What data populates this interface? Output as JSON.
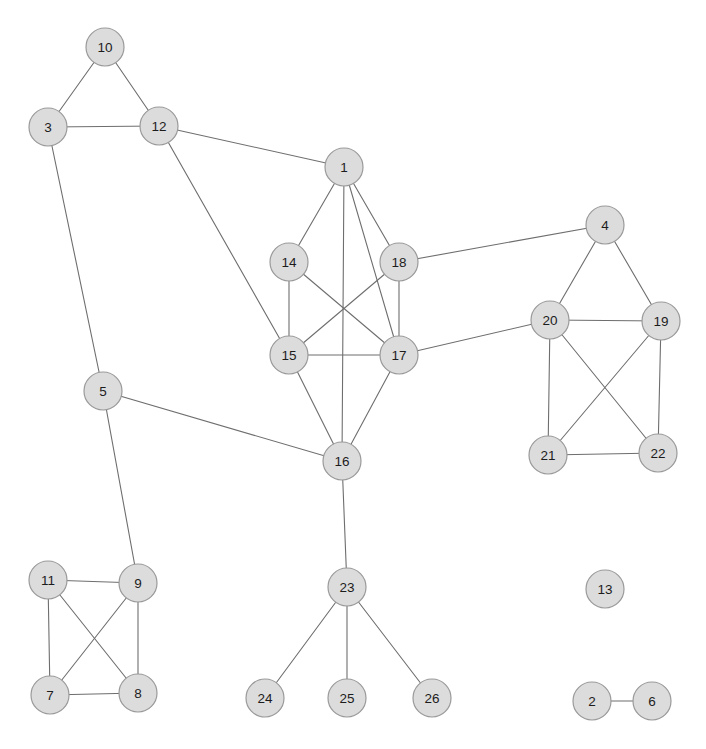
{
  "figure": {
    "type": "network-graph",
    "width": 706,
    "height": 749,
    "background_color": "#ffffff"
  },
  "style": {
    "node_fill": "#dcdcdc",
    "node_stroke": "#9a9a9a",
    "node_radius": 19,
    "node_label_color": "#1c1c1c",
    "edge_color": "#6e6e6e",
    "edge_width": 1.1
  },
  "chart_data": {
    "type": "graph",
    "title": "",
    "node_count": 26,
    "edge_count": 42,
    "directed": false,
    "nodes": [
      {
        "id": 1,
        "label": "1",
        "x": 344,
        "y": 167
      },
      {
        "id": 2,
        "label": "2",
        "x": 592,
        "y": 701
      },
      {
        "id": 3,
        "label": "3",
        "x": 48,
        "y": 127
      },
      {
        "id": 4,
        "label": "4",
        "x": 605,
        "y": 225
      },
      {
        "id": 5,
        "label": "5",
        "x": 103,
        "y": 391
      },
      {
        "id": 6,
        "label": "6",
        "x": 652,
        "y": 701
      },
      {
        "id": 7,
        "label": "7",
        "x": 50,
        "y": 695
      },
      {
        "id": 8,
        "label": "8",
        "x": 138,
        "y": 693
      },
      {
        "id": 9,
        "label": "9",
        "x": 138,
        "y": 583
      },
      {
        "id": 10,
        "label": "10",
        "x": 105,
        "y": 47
      },
      {
        "id": 11,
        "label": "11",
        "x": 48,
        "y": 580
      },
      {
        "id": 12,
        "label": "12",
        "x": 159,
        "y": 126
      },
      {
        "id": 13,
        "label": "13",
        "x": 605,
        "y": 589
      },
      {
        "id": 14,
        "label": "14",
        "x": 289,
        "y": 262
      },
      {
        "id": 15,
        "label": "15",
        "x": 289,
        "y": 355
      },
      {
        "id": 16,
        "label": "16",
        "x": 342,
        "y": 461
      },
      {
        "id": 17,
        "label": "17",
        "x": 399,
        "y": 355
      },
      {
        "id": 18,
        "label": "18",
        "x": 399,
        "y": 262
      },
      {
        "id": 19,
        "label": "19",
        "x": 661,
        "y": 321
      },
      {
        "id": 20,
        "label": "20",
        "x": 550,
        "y": 320
      },
      {
        "id": 21,
        "label": "21",
        "x": 548,
        "y": 455
      },
      {
        "id": 22,
        "label": "22",
        "x": 658,
        "y": 453
      },
      {
        "id": 23,
        "label": "23",
        "x": 347,
        "y": 587
      },
      {
        "id": 24,
        "label": "24",
        "x": 265,
        "y": 698
      },
      {
        "id": 25,
        "label": "25",
        "x": 347,
        "y": 698
      },
      {
        "id": 26,
        "label": "26",
        "x": 432,
        "y": 698
      }
    ],
    "edges": [
      {
        "source": 10,
        "target": 3
      },
      {
        "source": 10,
        "target": 12
      },
      {
        "source": 3,
        "target": 12
      },
      {
        "source": 3,
        "target": 5
      },
      {
        "source": 12,
        "target": 1
      },
      {
        "source": 12,
        "target": 15
      },
      {
        "source": 5,
        "target": 9
      },
      {
        "source": 5,
        "target": 16
      },
      {
        "source": 1,
        "target": 14
      },
      {
        "source": 1,
        "target": 18
      },
      {
        "source": 1,
        "target": 17
      },
      {
        "source": 1,
        "target": 16
      },
      {
        "source": 14,
        "target": 15
      },
      {
        "source": 14,
        "target": 17
      },
      {
        "source": 15,
        "target": 17
      },
      {
        "source": 15,
        "target": 18
      },
      {
        "source": 15,
        "target": 16
      },
      {
        "source": 18,
        "target": 17
      },
      {
        "source": 18,
        "target": 4
      },
      {
        "source": 17,
        "target": 16
      },
      {
        "source": 17,
        "target": 20
      },
      {
        "source": 16,
        "target": 23
      },
      {
        "source": 4,
        "target": 20
      },
      {
        "source": 4,
        "target": 19
      },
      {
        "source": 20,
        "target": 19
      },
      {
        "source": 20,
        "target": 21
      },
      {
        "source": 20,
        "target": 22
      },
      {
        "source": 19,
        "target": 21
      },
      {
        "source": 19,
        "target": 22
      },
      {
        "source": 21,
        "target": 22
      },
      {
        "source": 11,
        "target": 9
      },
      {
        "source": 11,
        "target": 7
      },
      {
        "source": 11,
        "target": 8
      },
      {
        "source": 9,
        "target": 7
      },
      {
        "source": 9,
        "target": 8
      },
      {
        "source": 7,
        "target": 8
      },
      {
        "source": 23,
        "target": 24
      },
      {
        "source": 23,
        "target": 25
      },
      {
        "source": 23,
        "target": 26
      },
      {
        "source": 2,
        "target": 6
      }
    ],
    "isolated_nodes": [
      13
    ],
    "components": [
      {
        "name": "main-component",
        "nodes": [
          1,
          3,
          4,
          5,
          7,
          8,
          9,
          10,
          11,
          12,
          14,
          15,
          16,
          17,
          18,
          19,
          20,
          21,
          22,
          23,
          24,
          25,
          26
        ]
      },
      {
        "name": "pair-component",
        "nodes": [
          2,
          6
        ]
      },
      {
        "name": "singleton-component",
        "nodes": [
          13
        ]
      }
    ]
  }
}
